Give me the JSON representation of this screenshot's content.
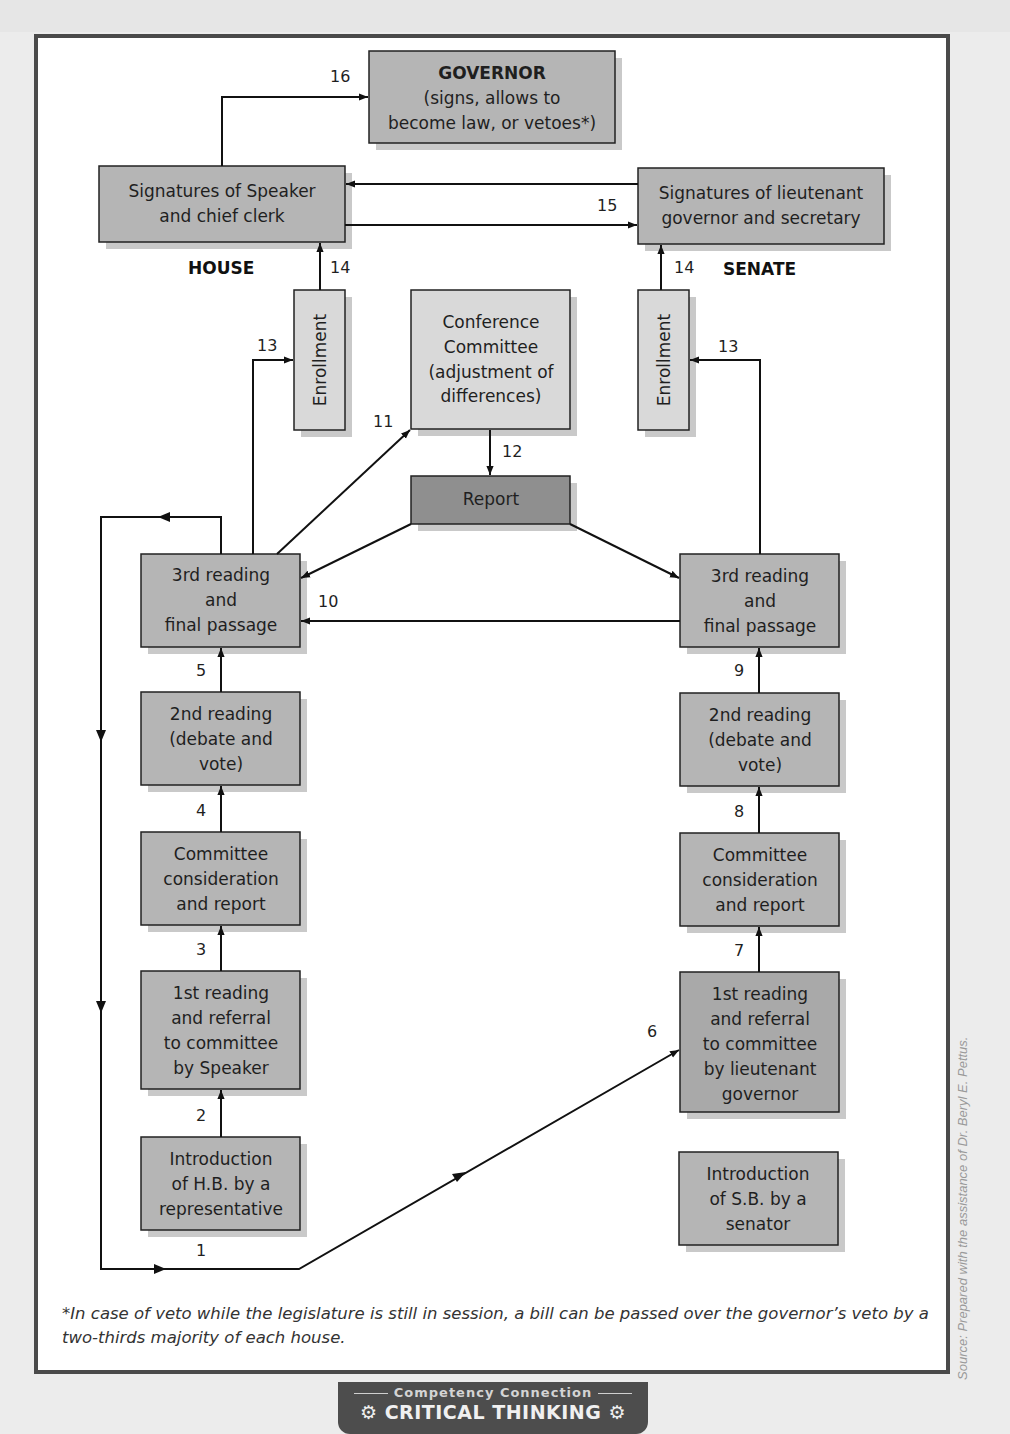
{
  "figure": {
    "chambers": {
      "house": "HOUSE",
      "senate": "SENATE"
    },
    "colors": {
      "box_medium": "#b5b5b5",
      "box_light": "#d9d9d9",
      "box_dark": "#8f8f8f",
      "shadow": "#c9c9c9",
      "line": "#111111"
    },
    "boxes": {
      "governor": {
        "title": "GOVERNOR",
        "lines": [
          "(signs, allows to",
          "become law, or vetoes*)"
        ]
      },
      "house_signatures": {
        "lines": [
          "Signatures of Speaker",
          "and chief clerk"
        ]
      },
      "senate_signatures": {
        "lines": [
          "Signatures of lieutenant",
          "governor and secretary"
        ]
      },
      "house_enrollment": {
        "label": "Enrollment"
      },
      "senate_enrollment": {
        "label": "Enrollment"
      },
      "conference": {
        "lines": [
          "Conference",
          "Committee",
          "(adjustment of",
          "differences)"
        ]
      },
      "report": {
        "lines": [
          "Report"
        ]
      },
      "house_third": {
        "lines": [
          "3rd reading",
          "and",
          "final passage"
        ]
      },
      "senate_third": {
        "lines": [
          "3rd reading",
          "and",
          "final passage"
        ]
      },
      "house_second": {
        "lines": [
          "2nd reading",
          "(debate and",
          "vote)"
        ]
      },
      "senate_second": {
        "lines": [
          "2nd reading",
          "(debate and",
          "vote)"
        ]
      },
      "house_committee": {
        "lines": [
          "Committee",
          "consideration",
          "and report"
        ]
      },
      "senate_committee": {
        "lines": [
          "Committee",
          "consideration",
          "and report"
        ]
      },
      "house_first": {
        "lines": [
          "1st reading",
          "and referral",
          "to committee",
          "by Speaker"
        ]
      },
      "senate_first": {
        "lines": [
          "1st reading",
          "and referral",
          "to committee",
          "by lieutenant",
          "governor"
        ]
      },
      "house_intro": {
        "lines": [
          "Introduction",
          "of H.B. by a",
          "representative"
        ]
      },
      "senate_intro": {
        "lines": [
          "Introduction",
          "of S.B. by a",
          "senator"
        ]
      }
    },
    "step_labels": {
      "s1": "1",
      "s2": "2",
      "s3": "3",
      "s4": "4",
      "s5": "5",
      "s6": "6",
      "s7": "7",
      "s8": "8",
      "s9": "9",
      "s10": "10",
      "s11": "11",
      "s12": "12",
      "s13_house": "13",
      "s13_senate": "13",
      "s14_house": "14",
      "s14_senate": "14",
      "s15": "15",
      "s16": "16"
    },
    "footnote": "*In case of veto while the legislature is still in session, a bill can be passed over the governor’s veto by a two-thirds majority of each house.",
    "source": "Source: Prepared with the assistance of Dr. Beryl E. Pettus."
  },
  "badge": {
    "subtitle": "Competency Connection",
    "title": "CRITICAL THINKING",
    "icon": "gear-icon"
  }
}
